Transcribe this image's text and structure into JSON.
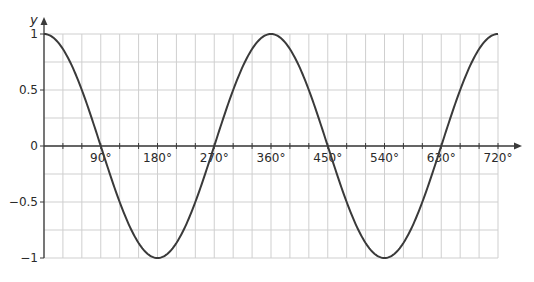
{
  "chart_data": {
    "type": "line",
    "title": "",
    "xlabel": "",
    "ylabel": "y",
    "function": "y = cos x",
    "xlim": [
      0,
      720
    ],
    "ylim": [
      -1,
      1
    ],
    "grid": true,
    "grid_x_step": 30,
    "grid_y_step": 0.25,
    "x_ticks": [
      90,
      180,
      270,
      360,
      450,
      540,
      630,
      720
    ],
    "x_tick_labels": [
      "90°",
      "180°",
      "270°",
      "360°",
      "450°",
      "540°",
      "630°",
      "720°"
    ],
    "y_ticks": [
      1,
      0.5,
      0,
      -0.5,
      -1
    ],
    "y_tick_labels": [
      "1",
      "0.5",
      "0",
      "−0.5",
      "−1"
    ],
    "series": [
      {
        "name": "cos x",
        "color": "#3a3a3a",
        "x": [
          0,
          30,
          60,
          90,
          120,
          150,
          180,
          210,
          240,
          270,
          300,
          330,
          360,
          390,
          420,
          450,
          480,
          510,
          540,
          570,
          600,
          630,
          660,
          690,
          720
        ],
        "values": [
          1,
          0.866,
          0.5,
          0,
          -0.5,
          -0.866,
          -1,
          -0.866,
          -0.5,
          0,
          0.5,
          0.866,
          1,
          0.866,
          0.5,
          0,
          -0.5,
          -0.866,
          -1,
          -0.866,
          -0.5,
          0,
          0.5,
          0.866,
          1
        ]
      }
    ],
    "legend": null
  },
  "colors": {
    "grid": "#cfcfcf",
    "axis": "#3a3a3a",
    "curve": "#3a3a3a"
  }
}
